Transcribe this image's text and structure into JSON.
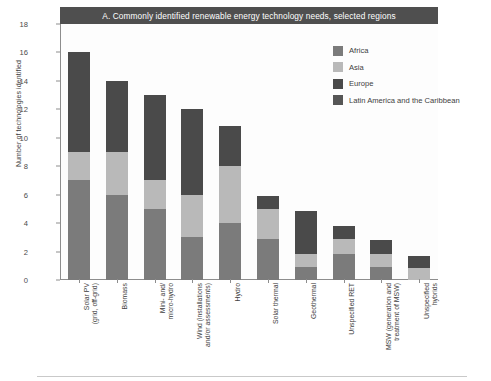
{
  "banner": {
    "title": "A. Commonly identified renewable energy technology needs, selected regions"
  },
  "axes": {
    "ylabel": "Number of technologies identified",
    "yticks": [
      "0",
      "2",
      "4",
      "6",
      "8",
      "10",
      "12",
      "14",
      "16",
      "18"
    ]
  },
  "legend": {
    "items": [
      {
        "label": "Africa",
        "color": "#7b7b7b"
      },
      {
        "label": "Asia",
        "color": "#b9b9b9"
      },
      {
        "label": "Europe",
        "color": "#4a4a4a"
      },
      {
        "label": "Latin America and the Caribbean",
        "color": "#565656"
      }
    ]
  },
  "chart_data": {
    "type": "bar",
    "subtype": "stacked-vertical",
    "title": "A. Commonly identified renewable energy technology needs, selected regions",
    "xlabel": "",
    "ylabel": "Number of technologies identified",
    "ylim": [
      0,
      18
    ],
    "ytick_step": 2,
    "grid": false,
    "legend_position": "top-right",
    "categories": [
      "Solar PV\n(grid, off-grid)",
      "Biomass",
      "Mini- and/\nmicro-hydro",
      "Wind (installations\nand/or assessments)",
      "Hydro",
      "Solar thermal",
      "Geothermal",
      "Unspecified RET",
      "MSW (generation and\ntreatment of MSW)",
      "Unspecified\nhybrids"
    ],
    "series": [
      {
        "name": "Africa",
        "color": "#7b7b7b",
        "values": [
          7,
          6,
          5,
          3,
          4,
          2.9,
          0.9,
          1.8,
          0.9,
          0
        ]
      },
      {
        "name": "Asia",
        "color": "#b9b9b9",
        "values": [
          2,
          3,
          2,
          3,
          4,
          2.1,
          0.9,
          1.05,
          0.95,
          0.85
        ]
      },
      {
        "name": "Europe",
        "color": "#4a4a4a",
        "values": [
          7,
          5,
          6,
          6,
          2.8,
          0.9,
          3.05,
          0.95,
          0.95,
          0.85
        ]
      },
      {
        "name": "Latin America and the Caribbean",
        "color": "#565656",
        "values": [
          0,
          0,
          0,
          0,
          0,
          0,
          0,
          0,
          0,
          0
        ]
      }
    ],
    "totals": [
      16,
      14,
      13,
      12,
      10.8,
      5.9,
      4.85,
      3.8,
      2.8,
      1.7
    ]
  }
}
